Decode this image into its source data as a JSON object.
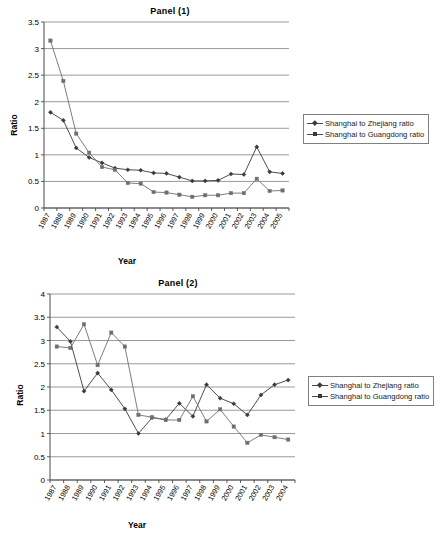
{
  "figure": {
    "panels": [
      {
        "id": "panel-1",
        "title": "Panel (1)",
        "xlabel": "Year",
        "ylabel": "Ratio"
      },
      {
        "id": "panel-2",
        "title": "Panel (2)",
        "xlabel": "Year",
        "ylabel": "Ratio"
      }
    ],
    "legend": {
      "series1_label": "Shanghai to Zhejiang ratio",
      "series2_label": "Shanghai to Guangdong ratio"
    },
    "colors": {
      "series1": "#3a3a3a",
      "series2": "#6e6e6e",
      "grid": "#808080",
      "axis": "#4a4a4a"
    }
  },
  "chart_data": [
    {
      "type": "line",
      "title": "Panel (1)",
      "xlabel": "Year",
      "ylabel": "Ratio",
      "ylim": [
        0,
        3.5
      ],
      "yticks": [
        "0",
        "0.5",
        "1",
        "1.5",
        "2",
        "2.5",
        "3",
        "3.5"
      ],
      "grid": true,
      "legend_position": "right",
      "categories": [
        "1987",
        "1988",
        "1989",
        "1990",
        "1991",
        "1992",
        "1993",
        "1994",
        "1995",
        "1996",
        "1997",
        "1998",
        "1999",
        "2000",
        "2001",
        "2002",
        "2003",
        "2004",
        "2005"
      ],
      "series": [
        {
          "name": "Shanghai to Zhejiang ratio",
          "marker": "diamond",
          "values": [
            1.8,
            1.65,
            1.13,
            0.95,
            0.85,
            0.75,
            0.72,
            0.71,
            0.66,
            0.65,
            0.58,
            0.51,
            0.51,
            0.52,
            0.64,
            0.63,
            1.15,
            0.68,
            0.65
          ]
        },
        {
          "name": "Shanghai to Guangdong ratio",
          "marker": "square",
          "values": [
            3.15,
            2.39,
            1.4,
            1.04,
            0.77,
            0.72,
            0.47,
            0.46,
            0.3,
            0.29,
            0.25,
            0.21,
            0.24,
            0.24,
            0.28,
            0.28,
            0.55,
            0.32,
            0.33
          ]
        }
      ]
    },
    {
      "type": "line",
      "title": "Panel (2)",
      "xlabel": "Year",
      "ylabel": "Ratio",
      "ylim": [
        0,
        4
      ],
      "yticks": [
        "0",
        "0.5",
        "1",
        "1.5",
        "2",
        "2.5",
        "3",
        "3.5",
        "4"
      ],
      "grid": true,
      "legend_position": "right",
      "categories": [
        "1987",
        "1988",
        "1989",
        "1990",
        "1991",
        "1992",
        "1993",
        "1994",
        "1995",
        "1996",
        "1997",
        "1998",
        "1999",
        "2000",
        "2001",
        "2002",
        "2003",
        "2004"
      ],
      "series": [
        {
          "name": "Shanghai to Zhejiang ratio",
          "marker": "diamond",
          "values": [
            3.29,
            2.98,
            1.91,
            2.3,
            1.94,
            1.53,
            1.0,
            1.34,
            1.3,
            1.65,
            1.37,
            2.05,
            1.76,
            1.64,
            1.4,
            1.83,
            2.05,
            2.15
          ]
        },
        {
          "name": "Shanghai to Guangdong ratio",
          "marker": "square",
          "values": [
            2.87,
            2.84,
            3.35,
            2.47,
            3.17,
            2.87,
            1.4,
            1.35,
            1.29,
            1.29,
            1.8,
            1.26,
            1.52,
            1.15,
            0.8,
            0.97,
            0.92,
            0.87
          ]
        }
      ]
    }
  ]
}
